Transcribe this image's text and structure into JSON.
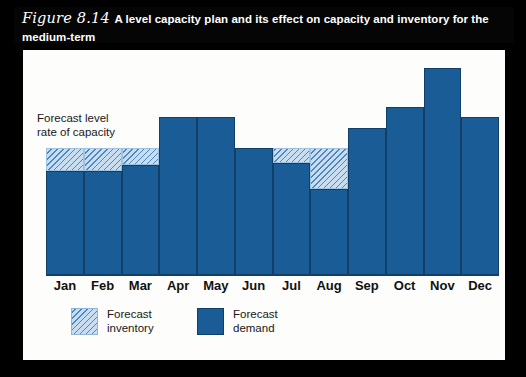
{
  "figure": {
    "number": "Figure 8.14",
    "title_line1": "A level capacity plan and its effect on capacity and inventory for the medium-term",
    "title_line2": "planning period"
  },
  "annotations": {
    "capacity_label": "Forecast level\nrate of capacity"
  },
  "legend": {
    "items": [
      {
        "key": "forecast-inventory",
        "label": "Forecast\ninventory",
        "color": "#c9ddf0",
        "pattern": "diagonal-hatch"
      },
      {
        "key": "forecast-demand",
        "label": "Forecast\ndemand",
        "color": "#1a5c96",
        "pattern": "solid"
      }
    ]
  },
  "colors": {
    "demand": "#1a5c96",
    "demand_edge": "#123f68",
    "inventory_fill": "#c9ddf0",
    "inventory_hatch": "#4d87bd",
    "capacity_line": "#0d2f52",
    "title_bar": "#050505",
    "panel": "#fdfdfb"
  },
  "chart_data": {
    "type": "bar",
    "title": "A level capacity plan and its effect on capacity and inventory for the medium-term planning period",
    "xlabel": "",
    "ylabel": "",
    "grid": false,
    "legend_position": "bottom-left",
    "ylim": [
      0,
      100
    ],
    "categories": [
      "Jan",
      "Feb",
      "Mar",
      "Apr",
      "May",
      "Jun",
      "Jul",
      "Aug",
      "Sep",
      "Oct",
      "Nov",
      "Dec"
    ],
    "capacity_level": 59,
    "capacity_level_label": "Forecast level rate of capacity",
    "series": [
      {
        "name": "Forecast demand",
        "values": [
          48,
          48,
          51,
          73,
          73,
          59,
          52,
          40,
          68,
          78,
          96,
          73
        ]
      },
      {
        "name": "Forecast inventory",
        "note": "shortfall between forecast demand and level capacity (stacked on top of demand)",
        "values": [
          11,
          11,
          8,
          0,
          0,
          0,
          7,
          19,
          0,
          0,
          0,
          0
        ]
      }
    ]
  }
}
